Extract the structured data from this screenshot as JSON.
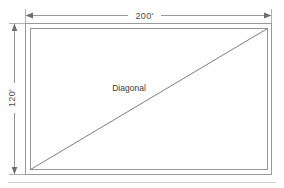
{
  "diagram": {
    "type": "rectangle-dimension-drawing",
    "title": "",
    "shape": {
      "name": "rectangle",
      "outline_color": "#9a9a9a",
      "inner_outline_color": "#8c8c8c",
      "fill": "#ffffff"
    },
    "dimensions": {
      "width_label": "200'",
      "height_label": "120'",
      "width_value": 200,
      "height_value": 120,
      "units": "feet",
      "line_color": "#7d7d7d",
      "text_color": "#4a4a4a"
    },
    "diagonal": {
      "label": "Diagonal",
      "line_color": "#6e6e6e",
      "from": "bottom-left",
      "to": "top-right"
    },
    "footer_rule": {
      "color": "#cfcfcf"
    }
  }
}
